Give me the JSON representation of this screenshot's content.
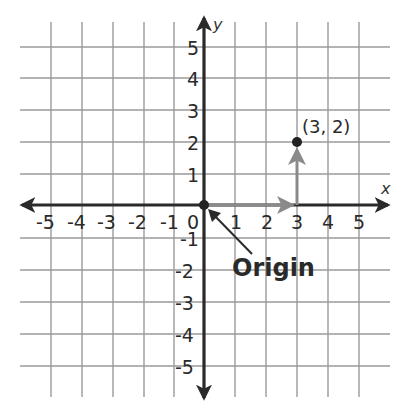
{
  "diagram": {
    "type": "coordinate-plane",
    "x_axis": {
      "name": "x",
      "min": -5,
      "max": 5,
      "ticks": [
        "-5",
        "-4",
        "-3",
        "-2",
        "-1",
        "0",
        "1",
        "2",
        "3",
        "4",
        "5"
      ]
    },
    "y_axis": {
      "name": "y",
      "min": -5,
      "max": 5,
      "ticks": [
        "5",
        "4",
        "3",
        "2",
        "1",
        "-1",
        "-2",
        "-3",
        "-4",
        "-5"
      ]
    },
    "point": {
      "label": "(3, 2)",
      "x": 3,
      "y": 2
    },
    "origin_label": "Origin",
    "path": [
      {
        "from": [
          0,
          0
        ],
        "to": [
          3,
          0
        ],
        "direction": "right"
      },
      {
        "from": [
          3,
          0
        ],
        "to": [
          3,
          2
        ],
        "direction": "up"
      }
    ],
    "colors": {
      "grid": "#9a9a9a",
      "axis": "#2a2a2a",
      "path": "#8a8a8a",
      "point": "#222222"
    }
  },
  "labels": {
    "x_name": "x",
    "y_name": "y",
    "point": "(3, 2)",
    "origin": "Origin",
    "x": {
      "n5": "-5",
      "n4": "-4",
      "n3": "-3",
      "n2": "-2",
      "n1": "-1",
      "zero": "0",
      "p1": "1",
      "p2": "2",
      "p3": "3",
      "p4": "4",
      "p5": "5"
    },
    "y": {
      "p5": "5",
      "p4": "4",
      "p3": "3",
      "p2": "2",
      "p1": "1",
      "n1": "-1",
      "n2": "-2",
      "n3": "-3",
      "n4": "-4",
      "n5": "-5"
    }
  }
}
